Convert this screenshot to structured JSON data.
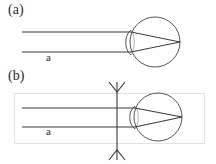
{
  "figure": {
    "caption_labels": {
      "panel_a": "(a)",
      "panel_b": "(b)"
    },
    "ray_bundle_labels": {
      "panel_a": "a",
      "panel_b": "a"
    },
    "colors": {
      "ray_stroke": "#3a3a3a",
      "eye_stroke": "#555555",
      "box_stroke": "#e2e2e2",
      "text": "#2b2b2b",
      "background": "#fefefe"
    }
  },
  "chart_data": {
    "type": "diagram",
    "title": "",
    "subtitle": "",
    "xlabel": "",
    "ylabel": "",
    "panels": [
      {
        "id": "a",
        "label": "(a)",
        "has_enclosing_box": false,
        "has_external_lens": false,
        "annotations": [
          {
            "text": "a",
            "x": 48,
            "y": 57,
            "meaning": "beam-width"
          }
        ],
        "eye": {
          "center_x": 155,
          "center_y": 42,
          "radius": 25,
          "cornea_lens": {
            "left_x": 131,
            "top_y": 30,
            "bottom_y": 55,
            "bulge_x": 124
          },
          "retina_focus": {
            "x": 180,
            "y": 42
          }
        },
        "rays": [
          {
            "name": "upper-marginal-ray",
            "points": [
              [
                22,
                32
              ],
              [
                131,
                32
              ],
              [
                180,
                42
              ]
            ]
          },
          {
            "name": "lower-marginal-ray",
            "points": [
              [
                22,
                52
              ],
              [
                131,
                52
              ],
              [
                180,
                42
              ]
            ]
          }
        ],
        "beam_width_px": 20
      },
      {
        "id": "b",
        "label": "(b)",
        "has_enclosing_box": true,
        "has_external_lens": true,
        "box": {
          "x": 14,
          "y": 93,
          "width": 190,
          "height": 50
        },
        "annotations": [
          {
            "text": "a",
            "x": 48,
            "y": 131,
            "meaning": "beam-width"
          }
        ],
        "external_lens": {
          "name": "lens-axis-with-arrowheads",
          "x": 117,
          "top_y": 82,
          "bottom_y": 160,
          "arrow_half_width": 8,
          "arrow_height": 10
        },
        "eye": {
          "center_x": 158,
          "center_y": 117,
          "radius": 24,
          "cornea_lens": {
            "left_x": 135,
            "top_y": 106,
            "bottom_y": 129,
            "bulge_x": 128
          },
          "retina_focus": {
            "x": 182,
            "y": 117
          }
        },
        "rays": [
          {
            "name": "upper-marginal-ray",
            "points": [
              [
                22,
                108
              ],
              [
                135,
                108
              ],
              [
                182,
                117
              ]
            ]
          },
          {
            "name": "lower-marginal-ray",
            "points": [
              [
                22,
                127
              ],
              [
                135,
                127
              ],
              [
                182,
                117
              ]
            ]
          }
        ],
        "beam_width_px": 19
      }
    ],
    "legend": [],
    "grid": false
  }
}
